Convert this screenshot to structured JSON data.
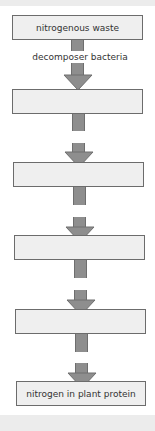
{
  "diagram": {
    "title": "",
    "colors": {
      "box_fill": "#efefef",
      "box_border": "#6c6c6c",
      "arrow_fill": "#8e8e8e",
      "arrow_border": "#6e6e6e",
      "text": "#333333",
      "band": "#ececec"
    },
    "boxes": [
      {
        "label": "nitrogenous waste"
      },
      {
        "label": ""
      },
      {
        "label": ""
      },
      {
        "label": ""
      },
      {
        "label": ""
      },
      {
        "label": "nitrogen in plant protein"
      }
    ],
    "arrows": [
      {
        "label": "decomposer bacteria"
      },
      {
        "label": ""
      },
      {
        "label": ""
      },
      {
        "label": ""
      },
      {
        "label": ""
      }
    ]
  }
}
